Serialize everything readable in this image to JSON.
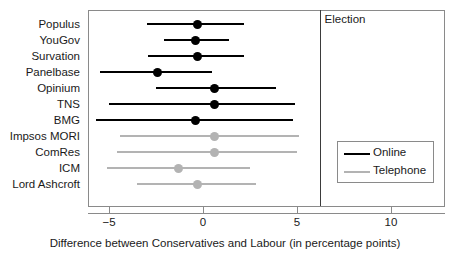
{
  "chart_data": {
    "type": "scatter",
    "title": "",
    "xlabel": "Difference between Conservatives and Labour (in percentage points)",
    "ylabel": "",
    "xlim": [
      -6.8,
      12.3
    ],
    "xticks": [
      -5,
      0,
      5,
      10
    ],
    "xtick_labels": [
      "−5",
      "0",
      "5",
      "10"
    ],
    "grid": false,
    "legend_position": "bottom-right",
    "annotations": [
      {
        "name": "election",
        "label": "Election",
        "x": 6.2,
        "type": "vline"
      }
    ],
    "series": [
      {
        "name": "Online",
        "color": "#000000"
      },
      {
        "name": "Telephone",
        "color": "#b3b3b3"
      }
    ],
    "categories": [
      "Populus",
      "YouGov",
      "Survation",
      "Panelbase",
      "Opinium",
      "TNS",
      "BMG",
      "Impsos MORI",
      "ComRes",
      "ICM",
      "Lord Ashcroft"
    ],
    "points": [
      {
        "label": "Populus",
        "mode": "Online",
        "estimate": -0.3,
        "low": -3.0,
        "high": 2.2
      },
      {
        "label": "YouGov",
        "mode": "Online",
        "estimate": -0.4,
        "low": -2.1,
        "high": 1.4
      },
      {
        "label": "Survation",
        "mode": "Online",
        "estimate": -0.3,
        "low": -2.9,
        "high": 2.2
      },
      {
        "label": "Panelbase",
        "mode": "Online",
        "estimate": -2.4,
        "low": -5.5,
        "high": 0.5
      },
      {
        "label": "Opinium",
        "mode": "Online",
        "estimate": 0.6,
        "low": -2.5,
        "high": 3.9
      },
      {
        "label": "TNS",
        "mode": "Online",
        "estimate": 0.6,
        "low": -5.0,
        "high": 4.9
      },
      {
        "label": "BMG",
        "mode": "Online",
        "estimate": -0.4,
        "low": -5.7,
        "high": 4.8
      },
      {
        "label": "Impsos MORI",
        "mode": "Telephone",
        "estimate": 0.6,
        "low": -4.4,
        "high": 5.1
      },
      {
        "label": "ComRes",
        "mode": "Telephone",
        "estimate": 0.6,
        "low": -4.6,
        "high": 5.0
      },
      {
        "label": "ICM",
        "mode": "Telephone",
        "estimate": -1.3,
        "low": -5.1,
        "high": 2.5
      },
      {
        "label": "Lord Ashcroft",
        "mode": "Telephone",
        "estimate": -0.3,
        "low": -3.5,
        "high": 2.8
      }
    ]
  },
  "legend": {
    "items": [
      {
        "label": "Online",
        "mode": "online"
      },
      {
        "label": "Telephone",
        "mode": "phone"
      }
    ]
  }
}
